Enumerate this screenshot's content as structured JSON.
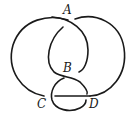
{
  "diagram": {
    "type": "knot-diagram",
    "labels": {
      "a": "A",
      "b": "B",
      "c": "C",
      "d": "D"
    },
    "stroke_color": "#1a1a1a",
    "background": "#ffffff"
  }
}
